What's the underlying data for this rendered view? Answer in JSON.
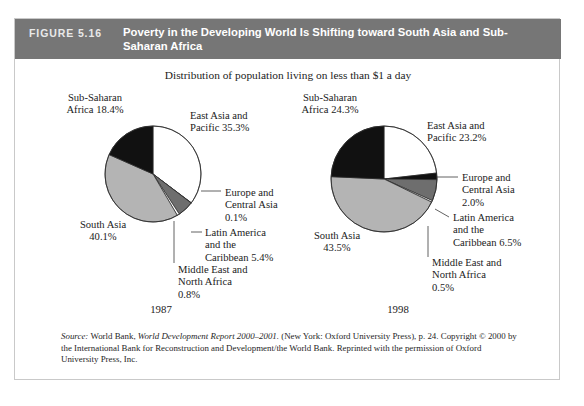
{
  "figure": {
    "number_label": "FIGURE 5.16",
    "title": "Poverty in the Developing World Is Shifting toward South Asia and Sub-Saharan Africa",
    "subtitle": "Distribution of population living on less than $1 a day",
    "header_bg": "#767676",
    "frame_border": "#c9c9c9"
  },
  "source": {
    "label": "Source:",
    "publisher": "World Bank,",
    "title": "World Development Report 2000–2001.",
    "rest": "(New York: Oxford University Press), p. 24. Copyright © 2000 by the International Bank for Reconstruction and Development/the World Bank. Reprinted with the permission of Oxford University Press, Inc."
  },
  "palette": {
    "white": "#ffffff",
    "light_gray": "#b4b4b4",
    "dark_gray": "#6e6e6e",
    "black": "#111111",
    "outline": "#2a2a2a"
  },
  "chart_data": [
    {
      "type": "pie",
      "title": "1987",
      "year": "1987",
      "unit": "%",
      "start_angle_deg": 0,
      "direction": "clockwise",
      "categories": [
        "East Asia and Pacific",
        "Europe and Central Asia",
        "Latin America and the Caribbean",
        "Middle East and North Africa",
        "South Asia",
        "Sub-Saharan Africa"
      ],
      "values": [
        35.3,
        0.1,
        5.4,
        0.8,
        40.1,
        18.4
      ],
      "colors": [
        "#ffffff",
        "#111111",
        "#6e6e6e",
        "#ffffff",
        "#b4b4b4",
        "#111111"
      ],
      "labels": [
        {
          "name": "East Asia and Pacific",
          "value": 35.3,
          "lines": [
            "East Asia and",
            "Pacific 35.3%"
          ]
        },
        {
          "name": "Europe and Central Asia",
          "value": 0.1,
          "lines": [
            "Europe and",
            "Central Asia",
            "0.1%"
          ]
        },
        {
          "name": "Latin America and the Caribbean",
          "value": 5.4,
          "lines": [
            "Latin America",
            "and the",
            "Caribbean 5.4%"
          ]
        },
        {
          "name": "Middle East and North Africa",
          "value": 0.8,
          "lines": [
            "Middle East and",
            "North Africa",
            "0.8%"
          ]
        },
        {
          "name": "South Asia",
          "value": 40.1,
          "lines": [
            "South Asia",
            "40.1%"
          ]
        },
        {
          "name": "Sub-Saharan Africa",
          "value": 18.4,
          "lines": [
            "Sub-Saharan",
            "Africa 18.4%"
          ]
        }
      ]
    },
    {
      "type": "pie",
      "title": "1998",
      "year": "1998",
      "unit": "%",
      "start_angle_deg": 0,
      "direction": "clockwise",
      "categories": [
        "East Asia and Pacific",
        "Europe and Central Asia",
        "Latin America and the Caribbean",
        "Middle East and North Africa",
        "South Asia",
        "Sub-Saharan Africa"
      ],
      "values": [
        23.2,
        2.0,
        6.5,
        0.5,
        43.5,
        24.3
      ],
      "colors": [
        "#ffffff",
        "#111111",
        "#6e6e6e",
        "#ffffff",
        "#b4b4b4",
        "#111111"
      ],
      "labels": [
        {
          "name": "East Asia and Pacific",
          "value": 23.2,
          "lines": [
            "East Asia and",
            "Pacific 23.2%"
          ]
        },
        {
          "name": "Europe and Central Asia",
          "value": 2.0,
          "lines": [
            "Europe and",
            "Central Asia",
            "2.0%"
          ]
        },
        {
          "name": "Latin America and the Caribbean",
          "value": 6.5,
          "lines": [
            "Latin America",
            "and the",
            "Caribbean 6.5%"
          ]
        },
        {
          "name": "Middle East and North Africa",
          "value": 0.5,
          "lines": [
            "Middle East and",
            "North Africa",
            "0.5%"
          ]
        },
        {
          "name": "South Asia",
          "value": 43.5,
          "lines": [
            "South Asia",
            "43.5%"
          ]
        },
        {
          "name": "Sub-Saharan Africa",
          "value": 24.3,
          "lines": [
            "Sub-Saharan",
            "Africa 24.3%"
          ]
        }
      ]
    }
  ]
}
